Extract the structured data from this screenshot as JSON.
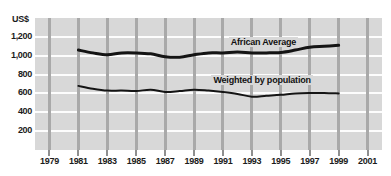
{
  "chart_data": {
    "type": "line",
    "title": "",
    "subtitle": "",
    "xlabel": "",
    "ylabel": "US$",
    "y_unit_label": "US$",
    "xlim": [
      1978,
      2002
    ],
    "ylim": [
      0,
      1400
    ],
    "y_ticks": [
      200,
      400,
      600,
      800,
      1000,
      1200
    ],
    "y_tick_labels": [
      "200",
      "400",
      "600",
      "800",
      "1,000",
      "1,200"
    ],
    "x_ticks": [
      1979,
      1981,
      1983,
      1985,
      1987,
      1989,
      1991,
      1993,
      1995,
      1997,
      1999,
      2001
    ],
    "x_tick_labels": [
      "1979",
      "1981",
      "1983",
      "1985",
      "1987",
      "1989",
      "1991",
      "1993",
      "1995",
      "1997",
      "1999",
      "2001"
    ],
    "grid": "horizontal-white-and-vertical-gray",
    "legend_position": "inline-annotations",
    "plot_background": "#d8d8d8",
    "line_color": "#141414",
    "x": [
      1981,
      1982,
      1983,
      1984,
      1985,
      1986,
      1987,
      1988,
      1989,
      1990,
      1991,
      1992,
      1993,
      1994,
      1995,
      1996,
      1997,
      1998,
      1999
    ],
    "series": [
      {
        "name": "African Average",
        "label": "African Average",
        "values": [
          1060,
          1030,
          1010,
          1030,
          1030,
          1020,
          990,
          985,
          1010,
          1030,
          1030,
          1040,
          1030,
          1030,
          1035,
          1060,
          1090,
          1100,
          1110
        ],
        "line_width_px": 3
      },
      {
        "name": "Weighted by population",
        "label": "Weighted by population",
        "values": [
          680,
          650,
          630,
          630,
          625,
          640,
          615,
          625,
          640,
          630,
          615,
          595,
          565,
          575,
          585,
          600,
          605,
          605,
          600
        ],
        "line_width_px": 2
      }
    ],
    "annotations": [
      {
        "text": "African Average",
        "x": 1991.4,
        "y": 1135
      },
      {
        "text": "Weighted by population",
        "x": 1990.2,
        "y": 735
      }
    ]
  }
}
